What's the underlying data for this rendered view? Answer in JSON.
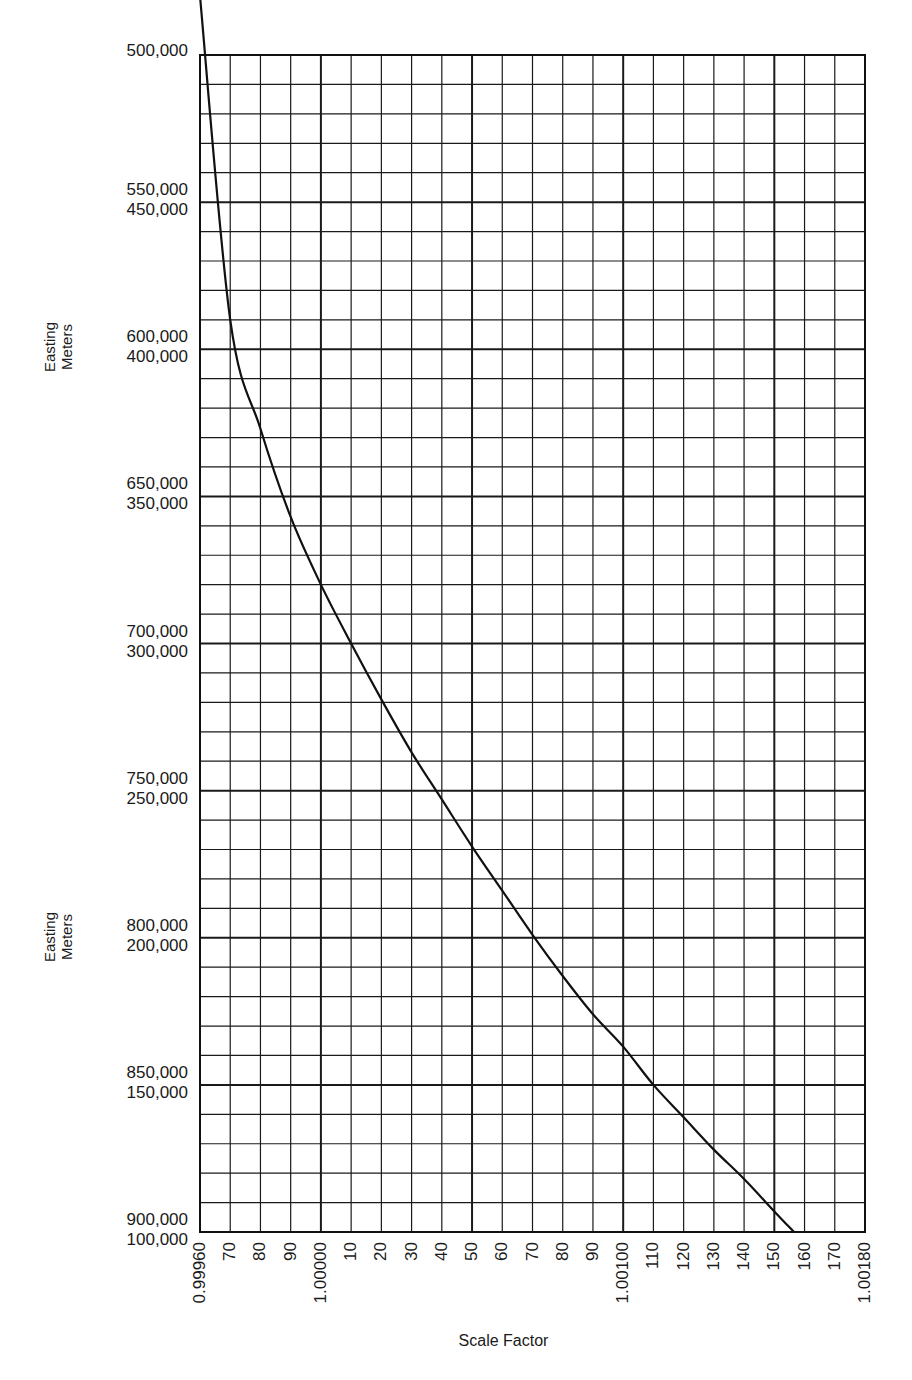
{
  "chart_data": {
    "type": "line",
    "title": "",
    "xlabel": "Scale Factor",
    "ylabel": "Easting Meters",
    "xlim": [
      0.9996,
      1.0018
    ],
    "ylim": [
      100000,
      500000
    ],
    "ylim_mirror": [
      900000,
      500000
    ],
    "grid": true,
    "legend": null,
    "x_tick_labels": [
      "0.99960",
      "70",
      "80",
      "90",
      "1.00000",
      "10",
      "20",
      "30",
      "40",
      "50",
      "60",
      "70",
      "80",
      "90",
      "1.00100",
      "110",
      "120",
      "130",
      "140",
      "150",
      "160",
      "170",
      "1.00180"
    ],
    "x_tick_values": [
      0.9996,
      0.9997,
      0.9998,
      0.9999,
      1.0,
      1.0001,
      1.0002,
      1.0003,
      1.0004,
      1.0005,
      1.0006,
      1.0007,
      1.0008,
      1.0009,
      1.001,
      1.0011,
      1.0012,
      1.0013,
      1.0014,
      1.0015,
      1.0016,
      1.0017,
      1.0018
    ],
    "y_tick_labels": [
      {
        "upper": "500,000",
        "lower": ""
      },
      {
        "upper": "550,000",
        "lower": "450,000"
      },
      {
        "upper": "600,000",
        "lower": "400,000"
      },
      {
        "upper": "650,000",
        "lower": "350,000"
      },
      {
        "upper": "700,000",
        "lower": "300,000"
      },
      {
        "upper": "750,000",
        "lower": "250,000"
      },
      {
        "upper": "800,000",
        "lower": "200,000"
      },
      {
        "upper": "850,000",
        "lower": "150,000"
      },
      {
        "upper": "900,000",
        "lower": "100,000"
      }
    ],
    "y_tick_values_west": [
      500000,
      450000,
      400000,
      350000,
      300000,
      250000,
      200000,
      150000,
      100000
    ],
    "y_tick_values_east": [
      500000,
      550000,
      600000,
      650000,
      700000,
      750000,
      800000,
      850000,
      900000
    ],
    "minor_grid": {
      "x_step": 0.0001,
      "y_step": 10000
    },
    "series": [
      {
        "name": "UTM scale factor vs easting",
        "x": [
          0.9996,
          0.9997,
          0.9998,
          0.9999,
          1.0,
          1.0001,
          1.0002,
          1.0003,
          1.0004,
          1.0005,
          1.0006,
          1.0007,
          1.0008,
          1.0009,
          1.001,
          1.0011,
          1.0012,
          1.0013,
          1.0014,
          1.0015,
          1.001565
        ],
        "y": [
          520000,
          410000,
          373000,
          343000,
          320000,
          300000,
          281000,
          263000,
          247000,
          231000,
          216000,
          201000,
          187000,
          174000,
          163000,
          150000,
          139000,
          128000,
          118000,
          107000,
          100000
        ]
      }
    ]
  },
  "axis": {
    "y_title_line1": "Easting",
    "y_title_line2": "Meters",
    "x_title": "Scale Factor"
  }
}
